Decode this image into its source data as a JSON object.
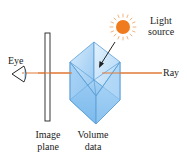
{
  "diagram": {
    "title": "",
    "labels": {
      "eye": "Eye",
      "light_line1": "Light",
      "light_line2": "source",
      "ray": "Ray",
      "image_line1": "Image",
      "image_line2": "plane",
      "volume_line1": "Volume",
      "volume_line2": "data"
    },
    "elements": [
      {
        "id": "eye",
        "icon": "eye-icon"
      },
      {
        "id": "image-plane",
        "shape": "thin-rectangle"
      },
      {
        "id": "volume-data",
        "shape": "cube"
      },
      {
        "id": "light-source",
        "icon": "sun-icon"
      },
      {
        "id": "ray",
        "shape": "horizontal-line"
      },
      {
        "id": "light-arrow",
        "shape": "arrow",
        "from": "light-source",
        "to": "volume-data"
      }
    ],
    "colors": {
      "ray": "#e07b39",
      "sun": "#f07a1e",
      "sun_rays": "#f5b27a",
      "cube_light": "#cfe6fb",
      "cube_mid": "#9cccf3",
      "cube_dark": "#6fb2e8",
      "cube_edge": "#5a9fd6",
      "plane_stroke": "#222222",
      "text": "#222222"
    }
  }
}
